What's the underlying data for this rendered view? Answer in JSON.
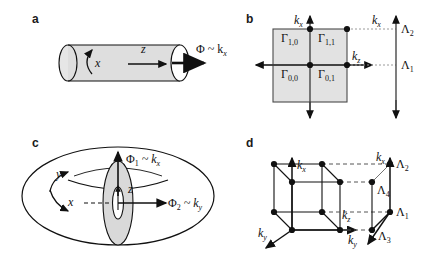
{
  "figure": {
    "width": 435,
    "height": 254,
    "background": "#ffffff",
    "ink_color": "#111111",
    "fill_gray": "#e2e2e2",
    "fill_gray_dark": "#cfcfcf"
  },
  "panels": {
    "a": {
      "letter": "a",
      "caption_flux": "Φ ~ k",
      "caption_flux_sub": "x",
      "axis_x": "x",
      "axis_z": "z",
      "shape": "cylinder"
    },
    "b": {
      "letter": "b",
      "axis_kx_top": "k",
      "axis_kx_top_sub": "x",
      "axis_kz_right": "k",
      "axis_kz_right_sub": "z",
      "axis_kx_side": "k",
      "axis_kx_side_sub": "x",
      "gamma_points": [
        {
          "label": "Γ",
          "sub": "1,0"
        },
        {
          "label": "Γ",
          "sub": "1,1"
        },
        {
          "label": "Γ",
          "sub": "0,0"
        },
        {
          "label": "Γ",
          "sub": "0,1"
        }
      ],
      "lambda_points": [
        {
          "label": "Λ",
          "sub": "2"
        },
        {
          "label": "Λ",
          "sub": "1"
        }
      ],
      "shape": "shaded-square-brillouin-zone"
    },
    "c": {
      "letter": "c",
      "flux1": "Φ",
      "flux1_sub": "1",
      "flux1_rel": " ~ k",
      "flux1_rel_sub": "x",
      "flux2": "Φ",
      "flux2_sub": "2",
      "flux2_rel": " ~ k",
      "flux2_rel_sub": "y",
      "axis_x": "x",
      "axis_y": "y",
      "axis_z": "z",
      "shape": "torus"
    },
    "d": {
      "letter": "d",
      "axis_kx": "k",
      "axis_kx_sub": "x",
      "axis_ky": "k",
      "axis_ky_sub": "y",
      "axis_kz": "k",
      "axis_kz_sub": "z",
      "axis_kx_side": "k",
      "axis_kx_side_sub": "x",
      "axis_ky_side": "k",
      "axis_ky_side_sub": "y",
      "lambda_points": [
        {
          "label": "Λ",
          "sub": "2"
        },
        {
          "label": "Λ",
          "sub": "4"
        },
        {
          "label": "Λ",
          "sub": "1"
        },
        {
          "label": "Λ",
          "sub": "3"
        }
      ],
      "shape": "cube-lattice"
    }
  }
}
